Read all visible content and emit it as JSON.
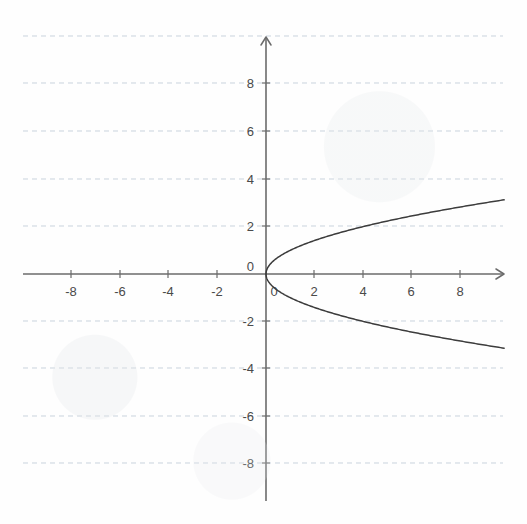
{
  "canvas": {
    "width": 527,
    "height": 524,
    "background_color": "#fefefe"
  },
  "chart_data": {
    "type": "line",
    "title": "",
    "subtitle": "",
    "xlabel": "",
    "ylabel": "",
    "xlim": [
      -10.2,
      9.9
    ],
    "ylim": [
      -10.2,
      10.0
    ],
    "grid": true,
    "grid_color": "#c9d3dd",
    "grid_style": "dashed",
    "legend": "none",
    "axis_color": "#6b6b6b",
    "curve_color": "#3c3c3c",
    "axes": {
      "x_axis_label": "",
      "y_axis_label": "",
      "x_arrow": "right",
      "y_arrow": "up",
      "origin_label": "0"
    },
    "xticks": [
      -8,
      -6,
      -4,
      -2,
      0,
      2,
      4,
      6,
      8
    ],
    "xtick_labels": [
      "-8",
      "-6",
      "-4",
      "-2",
      "0",
      "2",
      "4",
      "6",
      "8"
    ],
    "yticks": [
      -8,
      -6,
      -4,
      -2,
      0,
      2,
      4,
      6,
      8
    ],
    "ytick_labels": [
      "-8",
      "-6",
      "-4",
      "-2",
      "0",
      "2",
      "4",
      "6",
      "8"
    ],
    "x_gridlines": [],
    "y_gridlines": [
      -8,
      -6,
      -4,
      -2,
      2,
      4,
      6,
      8
    ],
    "series": [
      {
        "name": "upper-branch",
        "equation": "y = sqrt(x)",
        "x": [
          0,
          0.1,
          0.25,
          0.5,
          0.75,
          1,
          1.5,
          2,
          2.5,
          3,
          3.5,
          4,
          5,
          6,
          7,
          8,
          9,
          9.8
        ],
        "values": [
          0,
          0.316,
          0.5,
          0.707,
          0.866,
          1,
          1.225,
          1.414,
          1.581,
          1.732,
          1.871,
          2,
          2.236,
          2.449,
          2.646,
          2.828,
          3,
          3.13
        ]
      },
      {
        "name": "lower-branch",
        "equation": "y = -sqrt(x)",
        "x": [
          0,
          0.1,
          0.25,
          0.5,
          0.75,
          1,
          1.5,
          2,
          2.5,
          3,
          3.5,
          4,
          5,
          6,
          7,
          8,
          9,
          9.8
        ],
        "values": [
          0,
          -0.316,
          -0.5,
          -0.707,
          -0.866,
          -1,
          -1.225,
          -1.414,
          -1.581,
          -1.732,
          -1.871,
          -2,
          -2.236,
          -2.449,
          -2.646,
          -2.828,
          -3,
          -3.13
        ]
      }
    ],
    "annotations": []
  },
  "labels": {
    "x_neg_8": "-8",
    "x_neg_6": "-6",
    "x_neg_4": "-4",
    "x_neg_2": "-2",
    "x_zero": "0",
    "x_pos_2": "2",
    "x_pos_4": "4",
    "x_pos_6": "6",
    "x_pos_8": "8",
    "y_pos_8": "8",
    "y_pos_6": "6",
    "y_pos_4": "4",
    "y_pos_2": "2",
    "y_zero": "0",
    "y_neg_2": "-2",
    "y_neg_4": "-4",
    "y_neg_6": "-6",
    "y_neg_8": "-8"
  }
}
